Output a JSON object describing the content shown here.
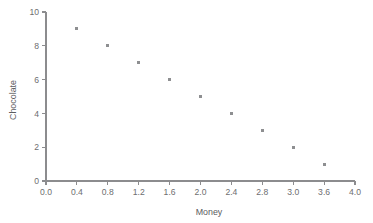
{
  "chart_data": {
    "type": "scatter",
    "title": "",
    "subtitle": "",
    "xlabel": "Money",
    "ylabel": "Chocolate",
    "xlim": [
      0.0,
      4.0
    ],
    "ylim": [
      0,
      10
    ],
    "grid": false,
    "legend": null,
    "legend_position": "none",
    "x_tick_labels": [
      "0.0",
      "0.4",
      "0.8",
      "1.2",
      "1.6",
      "2.0",
      "2.4",
      "2.8",
      "3.0",
      "3.6",
      "4.0"
    ],
    "x_tick_positions": [
      0.0,
      0.4,
      0.8,
      1.2,
      1.6,
      2.0,
      2.4,
      2.8,
      3.2,
      3.6,
      4.0
    ],
    "y_tick_labels": [
      "0",
      "2",
      "4",
      "6",
      "8",
      "10"
    ],
    "y_tick_positions": [
      0,
      2,
      4,
      6,
      8,
      10
    ],
    "marker": "square",
    "marker_color": "#8e8f91",
    "marker_size": 3,
    "series": [
      {
        "name": "chocolate-vs-money",
        "points": [
          {
            "x": 0.4,
            "y": 9
          },
          {
            "x": 0.8,
            "y": 8
          },
          {
            "x": 1.2,
            "y": 7
          },
          {
            "x": 1.6,
            "y": 6
          },
          {
            "x": 2.0,
            "y": 5
          },
          {
            "x": 2.4,
            "y": 4
          },
          {
            "x": 2.8,
            "y": 3
          },
          {
            "x": 3.2,
            "y": 2
          },
          {
            "x": 3.6,
            "y": 1
          }
        ]
      }
    ]
  },
  "axes": {
    "x_axis_label": "Money",
    "y_axis_label": "Chocolate"
  },
  "colors": {
    "background": "#ffffff",
    "axis": "#8c8c8e",
    "tick_text": "#6d6e70",
    "marker": "#8e8f91",
    "axis_title": "#5b5c5e"
  }
}
